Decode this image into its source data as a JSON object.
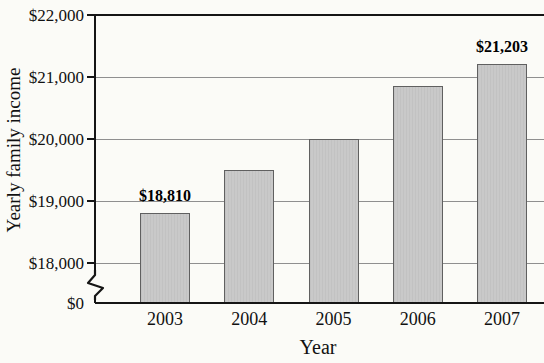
{
  "chart_data": {
    "type": "bar",
    "title": "",
    "xlabel": "Year",
    "ylabel": "Yearly family income",
    "categories": [
      "2003",
      "2004",
      "2005",
      "2006",
      "2007"
    ],
    "values": [
      18810,
      19500,
      20000,
      20850,
      21203
    ],
    "bar_value_labels": [
      {
        "category_index": 0,
        "text": "$18,810"
      },
      {
        "category_index": 4,
        "text": "$21,203"
      }
    ],
    "y_axis": {
      "ticks": [
        {
          "label": "$0",
          "value": 0,
          "grid": false
        },
        {
          "label": "$18,000",
          "value": 18000,
          "grid": true
        },
        {
          "label": "$19,000",
          "value": 19000,
          "grid": true
        },
        {
          "label": "$20,000",
          "value": 20000,
          "grid": true
        },
        {
          "label": "$21,000",
          "value": 21000,
          "grid": true
        },
        {
          "label": "$22,000",
          "value": 22000,
          "grid": false
        }
      ],
      "display_range": [
        18000,
        22000
      ],
      "axis_break": true
    },
    "grid": "horizontal",
    "legend": null
  },
  "colors": {
    "background": "#fbfbf7",
    "bar_fill": "#c9c9c9",
    "bar_border": "#606060",
    "gridline": "#8f8f8f",
    "axis": "#151515",
    "text": "#111111"
  }
}
